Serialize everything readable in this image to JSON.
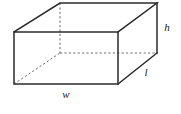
{
  "figure": {
    "shape_name": "rectangular-prism",
    "background_color": "#ffffff",
    "edge_color": "#2b2b2b",
    "hidden_edge_color": "#6a6a6a",
    "label_color": "#1a1a1a",
    "labels": {
      "height": "h",
      "length": "l",
      "width": "w"
    },
    "label_positions": {
      "height": {
        "x": 167,
        "y": 27
      },
      "length": {
        "x": 146,
        "y": 72
      },
      "width": {
        "x": 66,
        "y": 94
      }
    },
    "vertices": {
      "front_top_left": {
        "x": 14,
        "y": 32
      },
      "front_top_right": {
        "x": 118,
        "y": 32
      },
      "front_bottom_left": {
        "x": 14,
        "y": 84
      },
      "front_bottom_right": {
        "x": 118,
        "y": 84
      },
      "back_top_left": {
        "x": 60,
        "y": 3
      },
      "back_top_right": {
        "x": 157,
        "y": 3
      },
      "back_bottom_left": {
        "x": 60,
        "y": 53
      },
      "back_bottom_right": {
        "x": 157,
        "y": 53
      }
    },
    "edges": {
      "front_face": "M14,32 L118,32 L118,84 L14,84 Z",
      "top_face_back": "M14,32 L60,3 L157,3 L118,32",
      "right_vertical_back": "M157,3 L157,53",
      "right_face_diagonal": "M118,84 L157,53",
      "hidden_vertical": "M60,3 L60,53",
      "hidden_horizontal": "M60,53 L157,53",
      "hidden_diagonal": "M14,84 L60,53"
    }
  }
}
